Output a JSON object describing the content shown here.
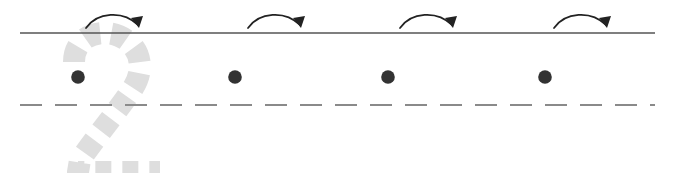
{
  "worksheet": {
    "title": "Number 2 handwriting tracing practice row",
    "type": "handwriting-practice-row",
    "width": 673,
    "height": 173,
    "background_color": "#ffffff",
    "character": "2",
    "character_label": "two"
  },
  "colors": {
    "baseline_solid": "#555555",
    "midline_dashed": "#8a8a8a",
    "trace_glyph": "#dedede",
    "start_dot": "#333333",
    "arrow": "#222222",
    "background": "#ffffff"
  },
  "guide_lines": {
    "top_solid": {
      "name": "top-solid-rule",
      "y": 33,
      "x_start": 20,
      "x_end": 655,
      "style": "solid",
      "color": "#555555",
      "width": 1.6
    },
    "middle_dashed": {
      "name": "middle-dashed-rule",
      "y": 105,
      "x_start": 20,
      "x_end": 655,
      "style": "dashed",
      "color": "#8a8a8a",
      "width": 1.8,
      "dash": 22,
      "gap": 13
    }
  },
  "trace_glyph": {
    "name": "dashed-number-two",
    "character": "2",
    "color": "#dedede",
    "stroke_width": 22,
    "dash": 16,
    "gap": 11,
    "bounds": {
      "x": 62,
      "y": 33,
      "width": 95,
      "height": 145
    },
    "path": "M 74 62 C 74 36, 100 28, 119 36 C 140 45, 146 68, 133 88 C 120 108, 98 134, 80 160 L 78 172 L 160 172"
  },
  "start_dots": [
    {
      "name": "start-dot-1",
      "cx": 78,
      "cy": 77,
      "r": 6.8,
      "color": "#333333"
    },
    {
      "name": "start-dot-2",
      "cx": 235,
      "cy": 77,
      "r": 6.8,
      "color": "#333333"
    },
    {
      "name": "start-dot-3",
      "cx": 388,
      "cy": 77,
      "r": 6.8,
      "color": "#333333"
    },
    {
      "name": "start-dot-4",
      "cx": 545,
      "cy": 77,
      "r": 6.8,
      "color": "#333333"
    }
  ],
  "direction_arrows": [
    {
      "name": "direction-arrow-1",
      "direction": "left-to-right-arc-up",
      "path": "M 86 28 C 97 12, 123 10, 138 25",
      "head": "M 139 28 L 131 18 L 143 16 Z",
      "color": "#222222"
    },
    {
      "name": "direction-arrow-2",
      "direction": "left-to-right-arc-up",
      "path": "M 248 28 C 259 12, 285 10, 300 25",
      "head": "M 301 28 L 293 18 L 305 16 Z",
      "color": "#222222"
    },
    {
      "name": "direction-arrow-3",
      "direction": "left-to-right-arc-up",
      "path": "M 400 28 C 411 12, 437 10, 452 25",
      "head": "M 453 28 L 445 18 L 457 16 Z",
      "color": "#222222"
    },
    {
      "name": "direction-arrow-4",
      "direction": "left-to-right-arc-up",
      "path": "M 554 28 C 565 12, 591 10, 606 25",
      "head": "M 607 28 L 599 18 L 611 16 Z",
      "color": "#222222"
    }
  ],
  "practice_slots": [
    {
      "name": "practice-slot-1",
      "index": 1,
      "has_trace_guide": true,
      "has_start_dot": true,
      "has_arrow": true
    },
    {
      "name": "practice-slot-2",
      "index": 2,
      "has_trace_guide": false,
      "has_start_dot": true,
      "has_arrow": true
    },
    {
      "name": "practice-slot-3",
      "index": 3,
      "has_trace_guide": false,
      "has_start_dot": true,
      "has_arrow": true
    },
    {
      "name": "practice-slot-4",
      "index": 4,
      "has_trace_guide": false,
      "has_start_dot": true,
      "has_arrow": true
    }
  ]
}
